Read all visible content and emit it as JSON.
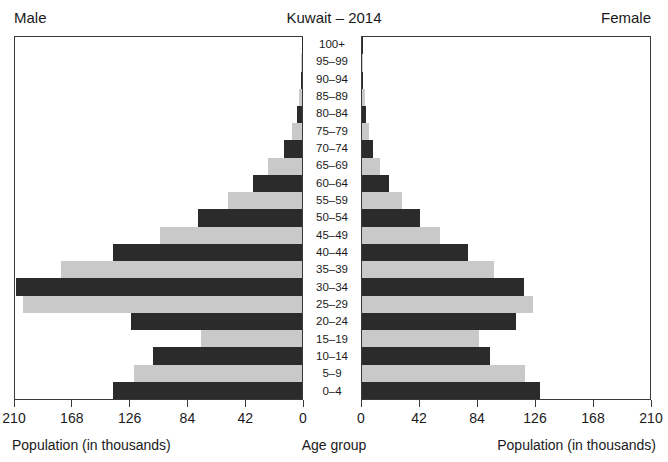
{
  "header": {
    "male_label": "Male",
    "title": "Kuwait – 2014",
    "female_label": "Female"
  },
  "captions": {
    "male_axis_title": "Population (in thousands)",
    "center_axis_title": "Age group",
    "female_axis_title": "Population (in thousands)"
  },
  "axes": {
    "male_ticks": [
      "210",
      "168",
      "126",
      "84",
      "42",
      "0"
    ],
    "female_ticks": [
      "0",
      "42",
      "84",
      "126",
      "168",
      "210"
    ],
    "max": 210,
    "tick_step": 42
  },
  "colors": {
    "bar_dark": "#2b2b2b",
    "bar_light": "#c9c9c9",
    "frame": "#3a3a3a",
    "text": "#1a1a1a",
    "background": "#ffffff"
  },
  "chart_data": {
    "type": "bar",
    "title": "Kuwait – 2014",
    "subtitle": "",
    "xlabel": "Population (in thousands)",
    "ylabel": "Age group",
    "xlim": [
      0,
      210
    ],
    "grid": false,
    "legend": [
      "Male",
      "Female"
    ],
    "legend_position": "top-corners",
    "orientation": "horizontal-diverging",
    "categories": [
      "0–4",
      "5–9",
      "10–14",
      "15–19",
      "20–24",
      "25–29",
      "30–34",
      "35–39",
      "40–44",
      "45–49",
      "50–54",
      "55–59",
      "60–64",
      "65–69",
      "70–74",
      "75–79",
      "80–84",
      "85–89",
      "90–94",
      "95–99",
      "100+"
    ],
    "series": [
      {
        "name": "Male",
        "side": "left",
        "values": [
          138,
          123,
          109,
          74,
          125,
          204,
          209,
          176,
          138,
          104,
          76,
          54,
          36,
          25,
          13,
          7,
          4,
          2,
          1,
          0.4,
          0.2
        ]
      },
      {
        "name": "Female",
        "side": "right",
        "values": [
          130,
          119,
          93,
          85,
          112,
          125,
          118,
          96,
          77,
          57,
          42,
          29,
          20,
          13,
          8,
          5,
          3,
          2,
          1,
          0.4,
          0.2
        ]
      }
    ],
    "bar_shading": {
      "pattern": "alternating",
      "even_index_color": "#2b2b2b",
      "odd_index_color": "#c9c9c9"
    }
  }
}
